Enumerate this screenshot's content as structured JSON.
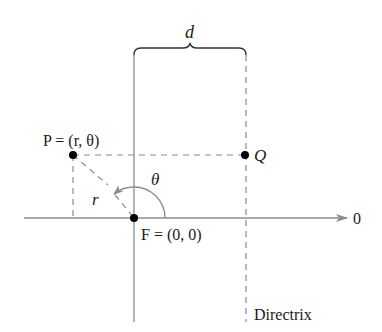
{
  "diagram": {
    "colors": {
      "axis": "#8c8c8c",
      "dashed": "#8c8c8c",
      "point": "#000000",
      "text": "#1a1a1a",
      "background": "#ffffff"
    },
    "labels": {
      "distance": "d",
      "point_p": "P = (r, θ)",
      "point_q": "Q",
      "radius": "r",
      "angle": "θ",
      "focus": "F = (0, 0)",
      "polar_axis": "0",
      "directrix": "Directrix"
    },
    "points": {
      "P": {
        "x": 73,
        "y": 155
      },
      "Q": {
        "x": 245,
        "y": 155
      },
      "F": {
        "x": 134,
        "y": 218
      }
    }
  }
}
